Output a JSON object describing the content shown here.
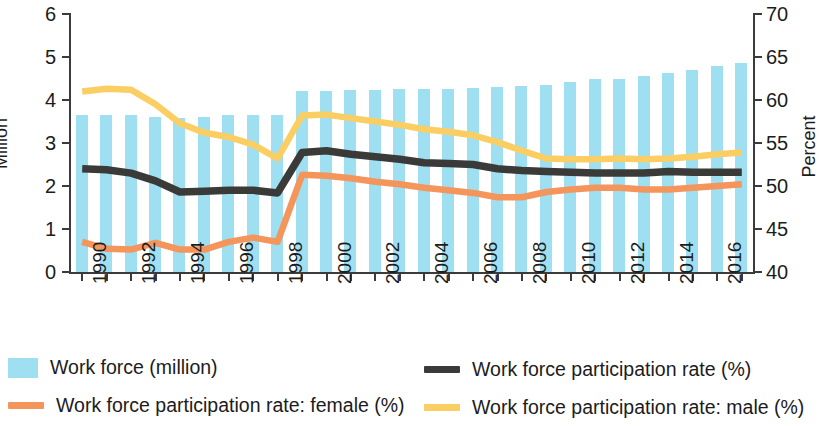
{
  "chart_data": {
    "type": "bar",
    "title": "",
    "subtitle": "",
    "xlabel": "",
    "ylabel": "Million",
    "y2label": "Percent",
    "ylim": [
      0,
      6
    ],
    "y2lim": [
      40,
      70
    ],
    "ytick_labels": [
      "0",
      "1",
      "2",
      "3",
      "4",
      "5",
      "6"
    ],
    "y2tick_labels": [
      "40",
      "45",
      "50",
      "55",
      "60",
      "65",
      "70"
    ],
    "grid": false,
    "legend_position": "bottom",
    "x": [
      1990,
      1991,
      1992,
      1993,
      1994,
      1995,
      1996,
      1997,
      1998,
      1999,
      2000,
      2001,
      2002,
      2003,
      2004,
      2005,
      2006,
      2007,
      2008,
      2009,
      2010,
      2011,
      2012,
      2013,
      2014,
      2015,
      2016,
      2017
    ],
    "xtick_labels": [
      "1990",
      "1992",
      "1994",
      "1996",
      "1998",
      "2000",
      "2002",
      "2004",
      "2006",
      "2008",
      "2010",
      "2012",
      "2014",
      "2016"
    ],
    "categories": [
      "1990",
      "1991",
      "1992",
      "1993",
      "1994",
      "1995",
      "1996",
      "1997",
      "1998",
      "1999",
      "2000",
      "2001",
      "2002",
      "2003",
      "2004",
      "2005",
      "2006",
      "2007",
      "2008",
      "2009",
      "2010",
      "2011",
      "2012",
      "2013",
      "2014",
      "2015",
      "2016",
      "2017"
    ],
    "values": [
      3.66,
      3.66,
      3.65,
      3.6,
      3.58,
      3.6,
      3.64,
      3.66,
      3.64,
      4.22,
      4.22,
      4.23,
      4.24,
      4.25,
      4.26,
      4.26,
      4.28,
      4.3,
      4.32,
      4.35,
      4.42,
      4.48,
      4.5,
      4.55,
      4.62,
      4.7,
      4.78,
      4.85
    ],
    "series": [
      {
        "name": "Work force (million)",
        "type": "bar",
        "axis": "left",
        "color": "#9fdff2",
        "values": [
          3.66,
          3.66,
          3.65,
          3.6,
          3.58,
          3.6,
          3.64,
          3.66,
          3.64,
          4.22,
          4.22,
          4.23,
          4.24,
          4.25,
          4.26,
          4.26,
          4.28,
          4.3,
          4.32,
          4.35,
          4.42,
          4.48,
          4.5,
          4.55,
          4.62,
          4.7,
          4.78,
          4.85
        ]
      },
      {
        "name": "Work force participation rate (%)",
        "type": "line",
        "axis": "right",
        "color": "#3a3a38",
        "values": [
          52.0,
          51.9,
          51.5,
          50.6,
          49.3,
          49.4,
          49.5,
          49.5,
          49.2,
          53.9,
          54.1,
          53.7,
          53.4,
          53.1,
          52.7,
          52.6,
          52.5,
          52.0,
          51.8,
          51.7,
          51.6,
          51.5,
          51.5,
          51.5,
          51.7,
          51.6,
          51.6,
          51.6
        ]
      },
      {
        "name": "Work force participation rate: female (%)",
        "type": "line",
        "axis": "right",
        "color": "#f4955c",
        "values": [
          43.5,
          42.7,
          42.6,
          43.4,
          42.6,
          42.6,
          43.5,
          44.0,
          43.5,
          51.3,
          51.2,
          50.9,
          50.5,
          50.2,
          49.8,
          49.5,
          49.2,
          48.7,
          48.7,
          49.3,
          49.6,
          49.8,
          49.8,
          49.6,
          49.6,
          49.8,
          50.0,
          50.2
        ]
      },
      {
        "name": "Work force participation rate: male (%)",
        "type": "line",
        "axis": "right",
        "color": "#fbce63",
        "values": [
          61.0,
          61.3,
          61.2,
          59.5,
          57.3,
          56.2,
          55.7,
          54.8,
          53.2,
          58.2,
          58.3,
          57.9,
          57.5,
          57.1,
          56.6,
          56.3,
          55.9,
          55.1,
          54.1,
          53.2,
          53.1,
          53.1,
          53.2,
          53.1,
          53.2,
          53.4,
          53.7,
          53.9
        ]
      }
    ],
    "legend": [
      {
        "label": "Work force (million)",
        "marker": "box",
        "color": "#9fdff2"
      },
      {
        "label": "Work force participation rate: female (%)",
        "marker": "line",
        "color": "#f4955c"
      },
      {
        "label": "Work force participation rate (%)",
        "marker": "line",
        "color": "#3a3a38"
      },
      {
        "label": "Work force participation rate: male (%)",
        "marker": "line",
        "color": "#fbce63"
      }
    ]
  }
}
